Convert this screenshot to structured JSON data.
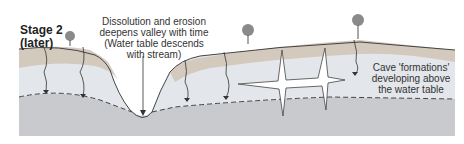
{
  "diagram": {
    "stage_title": "Stage 2",
    "stage_subtitle": "(later)",
    "annotations": {
      "valley": [
        "Dissolution and erosion",
        "deepens valley with time",
        "(Water table descends",
        "with stream)"
      ],
      "cave": [
        "Cave 'formations'",
        "developing above",
        "the water table"
      ]
    },
    "colors": {
      "soil": "#d3c9bd",
      "limestone_upper": "#e3e6ea",
      "limestone_lower": "#c8cacd",
      "outline": "#444444",
      "tree": "#8a8a8a"
    }
  }
}
